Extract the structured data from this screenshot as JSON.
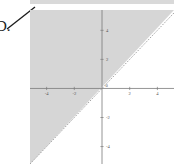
{
  "choice": {
    "letter": "D."
  },
  "chart_data": {
    "type": "line",
    "title": "",
    "subtitle": "",
    "xlabel": "",
    "ylabel": "",
    "xlim": [
      -5.2,
      5.2
    ],
    "ylim": [
      -5.2,
      5.4
    ],
    "grid": false,
    "legend": null,
    "x_ticks": [
      -4,
      -2,
      2,
      4
    ],
    "x_tick_labels": [
      "-4",
      "-2",
      "2",
      "4"
    ],
    "y_ticks": [
      -4,
      -2,
      2,
      4
    ],
    "y_tick_labels": [
      "-4",
      "-2",
      "2",
      "4"
    ],
    "origin_label": "0",
    "series": [
      {
        "name": "boundary-line",
        "type": "line",
        "style": "dashed",
        "color": "#9a9a9a",
        "equation": "y = x",
        "slope": 1,
        "intercept": 0,
        "x": [
          -5.2,
          5.2
        ],
        "values": [
          -5.2,
          5.2
        ]
      }
    ],
    "shaded_region": {
      "name": "solution-region",
      "inequality": "y > x",
      "side": "above-left",
      "fill": "#d6d6d6",
      "boundary_included": false,
      "polygon_x": [
        -5.2,
        5.2,
        -5.2
      ],
      "polygon_y": [
        5.4,
        5.4,
        -5.2
      ]
    },
    "annotations": []
  },
  "colors": {
    "shade": "#d6d6d6",
    "axis": "#7a7a7a",
    "boundary": "#9a9a9a",
    "tick_text": "#555555",
    "background": "#ffffff",
    "top_band": "#d9d9d9"
  }
}
